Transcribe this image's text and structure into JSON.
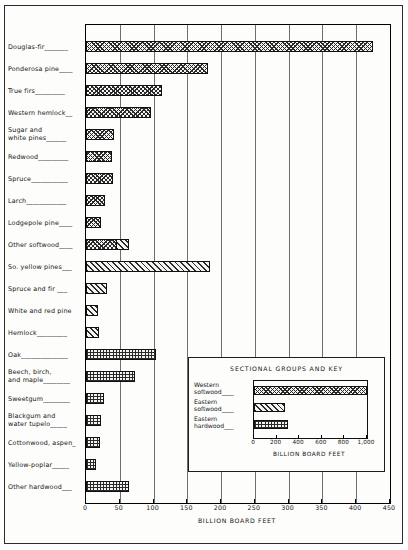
{
  "chart_data": {
    "type": "bar",
    "orientation": "horizontal",
    "title": "",
    "xlabel": "BILLION BOARD FEET",
    "ylabel": "",
    "xlim": [
      0,
      450
    ],
    "xticks": [
      0,
      50,
      100,
      150,
      200,
      250,
      300,
      350,
      400,
      450
    ],
    "xtick_labels": [
      "0",
      "50",
      "100",
      "150",
      "200",
      "250",
      "300",
      "350",
      "400",
      "450"
    ],
    "grid": true,
    "legend_position": "inset-lower-right",
    "categories": [
      "Douglas-fir",
      "Ponderosa pine",
      "True firs",
      "Western hemlock",
      "Sugar and\nwhite pines",
      "Redwood",
      "Spruce",
      "Larch",
      "Lodgepole pine",
      "Other softwood",
      "So. yellow pines",
      "Spruce and fir",
      "White and red pine",
      "Hemlock",
      "Oak",
      "Beech, birch,\nand maple",
      "Sweetgum",
      "Blackgum and\nwater tupelo",
      "Cottonwood, aspen",
      "Yellow-poplar",
      "Other hardwood"
    ],
    "values": [
      425,
      180,
      113,
      96,
      42,
      38,
      40,
      28,
      22,
      63,
      183,
      31,
      18,
      19,
      104,
      72,
      27,
      22,
      20,
      15,
      63
    ],
    "groups": [
      "western-softwood",
      "western-softwood",
      "western-softwood",
      "western-softwood",
      "western-softwood",
      "western-softwood",
      "western-softwood",
      "western-softwood",
      "western-softwood",
      "mixed-softwood",
      "eastern-softwood",
      "eastern-softwood",
      "eastern-softwood",
      "eastern-softwood",
      "eastern-hardwood",
      "eastern-hardwood",
      "eastern-hardwood",
      "eastern-hardwood",
      "eastern-hardwood",
      "eastern-hardwood",
      "eastern-hardwood"
    ],
    "label_suffix": [
      "Douglas-fir_______",
      "Ponderosa pine____",
      "True firs_________",
      "Western hemlock__",
      "Sugar and\n  white pines______",
      "Redwood_________",
      "Spruce___________",
      "Larch____________",
      "Lodgepole pine____",
      "Other softwood____",
      "So. yellow pines___",
      "Spruce and fir ___",
      "White and red pine",
      "Hemlock_________",
      "Oak______________",
      "Beech, birch,\n  and maple________",
      "Sweetgum________",
      "Blackgum and\n  water tupelo_____",
      "Cottonwood, aspen_",
      "Yellow-poplar_____",
      "Other hardwood___"
    ]
  },
  "legend": {
    "title": "SECTIONAL GROUPS AND KEY",
    "xlabel": "BILLION BOARD FEET",
    "xlim": [
      0,
      1000
    ],
    "xticks": [
      0,
      200,
      400,
      600,
      800,
      1000
    ],
    "xtick_labels": [
      "0",
      "200",
      "400",
      "600",
      "800",
      "1,000"
    ],
    "entries": [
      {
        "label": "Western\n  softwood____",
        "name": "Western softwood",
        "value": 1000,
        "group": "western-softwood"
      },
      {
        "label": "Eastern\n  softwood____",
        "name": "Eastern softwood",
        "value": 270,
        "group": "eastern-softwood"
      },
      {
        "label": "Eastern\n  hardwood___",
        "name": "Eastern hardwood",
        "value": 300,
        "group": "eastern-hardwood"
      }
    ]
  },
  "colors": {
    "ink": "#1a1a1a",
    "paper": "#fdfdfc",
    "grid": "#6e6e6e",
    "hatch": "#2a2a2a"
  }
}
